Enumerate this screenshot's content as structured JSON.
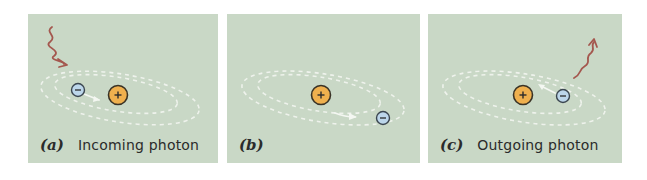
{
  "figure": {
    "colors": {
      "background": "#c9d8c6",
      "orbit": "#f4f7f2",
      "photon": "#a4574e",
      "nucleus_fill": "#efb04e",
      "nucleus_stroke": "#3a3326",
      "electron_fill": "#bcd6ea",
      "electron_stroke": "#3b4650",
      "caption_text": "#2b2b2b"
    },
    "panels": [
      {
        "id": "a",
        "letter": "(a)",
        "caption": "Incoming photon",
        "nucleus_symbol": "+",
        "electron_symbol": "−",
        "electron_state": "inner orbit",
        "photon": "incoming"
      },
      {
        "id": "b",
        "letter": "(b)",
        "caption": "",
        "nucleus_symbol": "+",
        "electron_symbol": "−",
        "electron_state": "outer orbit",
        "photon": "none"
      },
      {
        "id": "c",
        "letter": "(c)",
        "caption": "Outgoing photon",
        "nucleus_symbol": "+",
        "electron_symbol": "−",
        "electron_state": "returning to inner orbit",
        "photon": "outgoing"
      }
    ]
  }
}
